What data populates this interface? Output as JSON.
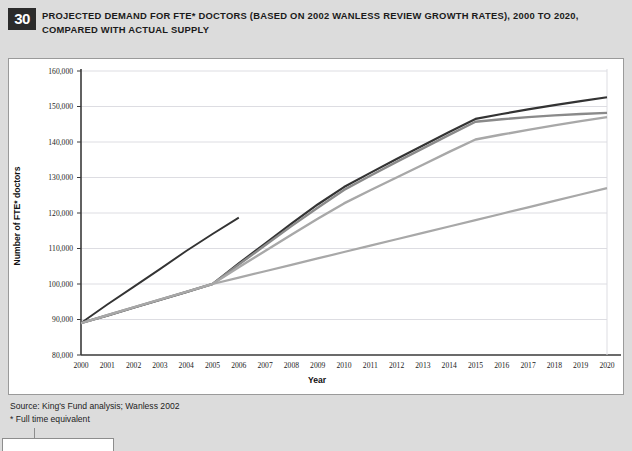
{
  "figure": {
    "number": "30",
    "title": "PROJECTED DEMAND FOR FTE* DOCTORS (BASED ON 2002 WANLESS REVIEW GROWTH RATES), 2000 TO 2020, COMPARED WITH ACTUAL SUPPLY",
    "source_line": "Source: King's Fund analysis; Wanless 2002",
    "footnote_line": "* Full time equivalent"
  },
  "colors": {
    "series_dark": "#333333",
    "series_medium": "#8a8a8a",
    "series_light": "#a8a8a8",
    "gridline": "#dddde2",
    "axis": "#3a3a3a",
    "plot_background": "#ffffff",
    "page_background": "#dcdcdc",
    "badge_background": "#2b2b2b"
  },
  "chart_data": {
    "type": "line",
    "title": "PROJECTED DEMAND FOR FTE* DOCTORS (BASED ON 2002 WANLESS REVIEW GROWTH RATES), 2000 TO 2020, COMPARED WITH ACTUAL SUPPLY",
    "xlabel": "Year",
    "ylabel": "Number of FTE* doctors",
    "x": [
      2000,
      2001,
      2002,
      2003,
      2004,
      2005,
      2006,
      2007,
      2008,
      2009,
      2010,
      2011,
      2012,
      2013,
      2014,
      2015,
      2016,
      2017,
      2018,
      2019,
      2020
    ],
    "xtick_labels": [
      "2000",
      "2001",
      "2002",
      "2003",
      "2004",
      "2005",
      "2006",
      "2007",
      "2008",
      "2009",
      "2010",
      "2011",
      "2012",
      "2013",
      "2014",
      "2015",
      "2016",
      "2017",
      "2018",
      "2019",
      "2020"
    ],
    "xlim": [
      2000,
      2020
    ],
    "ylim": [
      80000,
      160000
    ],
    "ytick_values": [
      80000,
      90000,
      100000,
      110000,
      120000,
      130000,
      140000,
      150000,
      160000
    ],
    "ytick_labels": [
      "80,000",
      "90,000",
      "100,000",
      "110,000",
      "120,000",
      "130,000",
      "140,000",
      "150,000",
      "160,000"
    ],
    "grid": true,
    "grid_axis": "y",
    "legend": false,
    "series": [
      {
        "name": "Actual supply",
        "color": "#333333",
        "width": 1.9,
        "x": [
          2000,
          2001,
          2002,
          2003,
          2004,
          2005,
          2006
        ],
        "values": [
          89000,
          94200,
          99200,
          104200,
          109300,
          114100,
          118700
        ]
      },
      {
        "name": "Projected demand (higher growth)",
        "color": "#333333",
        "width": 2.2,
        "x": [
          2000,
          2001,
          2002,
          2003,
          2004,
          2005,
          2006,
          2007,
          2008,
          2009,
          2010,
          2011,
          2012,
          2013,
          2014,
          2015,
          2016,
          2017,
          2018,
          2019,
          2020
        ],
        "values": [
          89000,
          91100,
          93300,
          95500,
          97700,
          100000,
          105800,
          111400,
          117000,
          122400,
          127300,
          131300,
          135200,
          139000,
          142800,
          146500,
          147900,
          149200,
          150400,
          151500,
          152600
        ]
      },
      {
        "name": "Projected demand (lower growth)",
        "color": "#8a8a8a",
        "width": 2.4,
        "x": [
          2000,
          2001,
          2002,
          2003,
          2004,
          2005,
          2006,
          2007,
          2008,
          2009,
          2010,
          2011,
          2012,
          2013,
          2014,
          2015,
          2016,
          2017,
          2018,
          2019,
          2020
        ],
        "values": [
          89000,
          91200,
          93400,
          95600,
          97800,
          100000,
          105500,
          110900,
          116300,
          121500,
          126500,
          130500,
          134400,
          138200,
          142000,
          145700,
          146400,
          147000,
          147500,
          147900,
          148200
        ]
      },
      {
        "name": "Projected demand (lowest growth)",
        "color": "#a8a8a8",
        "width": 2.4,
        "x": [
          2000,
          2001,
          2002,
          2003,
          2004,
          2005,
          2006,
          2007,
          2008,
          2009,
          2010,
          2011,
          2012,
          2013,
          2014,
          2015,
          2016,
          2017,
          2018,
          2019,
          2020
        ],
        "values": [
          89000,
          91200,
          93400,
          95600,
          97800,
          100000,
          104700,
          109300,
          113900,
          118400,
          122700,
          126400,
          130000,
          133600,
          137200,
          140700,
          142100,
          143400,
          144700,
          145900,
          147000
        ]
      },
      {
        "name": "Supply trend continuation",
        "color": "#a8a8a8",
        "width": 2.2,
        "x": [
          2005,
          2006,
          2007,
          2008,
          2009,
          2010,
          2011,
          2012,
          2013,
          2014,
          2015,
          2016,
          2017,
          2018,
          2019,
          2020
        ],
        "values": [
          100000,
          101800,
          103600,
          105400,
          107200,
          109000,
          110800,
          112600,
          114400,
          116200,
          118000,
          119800,
          121600,
          123400,
          125200,
          127000
        ]
      }
    ]
  }
}
